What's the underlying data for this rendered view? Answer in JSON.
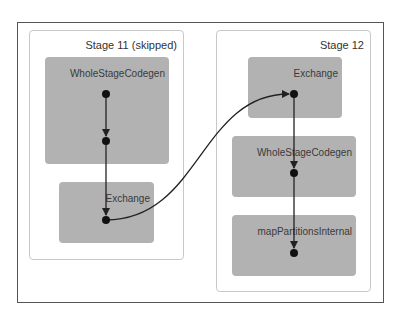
{
  "stages": [
    {
      "label": "Stage 11 (skipped)",
      "operators": [
        {
          "label": "WholeStageCodegen"
        },
        {
          "label": "Exchange"
        }
      ]
    },
    {
      "label": "Stage 12",
      "operators": [
        {
          "label": "Exchange"
        },
        {
          "label": "WholeStageCodegen"
        },
        {
          "label": "mapPartitionsInternal"
        }
      ]
    }
  ],
  "edges": [
    {
      "from": "stage11.WholeStageCodegen.node1",
      "to": "stage11.WholeStageCodegen.node2"
    },
    {
      "from": "stage11.WholeStageCodegen.node2",
      "to": "stage11.Exchange.node"
    },
    {
      "from": "stage11.Exchange.node",
      "to": "stage12.Exchange.node"
    },
    {
      "from": "stage12.Exchange.node",
      "to": "stage12.WholeStageCodegen.node"
    },
    {
      "from": "stage12.WholeStageCodegen.node",
      "to": "stage12.mapPartitionsInternal.node"
    }
  ],
  "colors": {
    "frame": "#555555",
    "stage_border": "#c8c8c8",
    "operator_fill": "#b2b2b2",
    "edge": "#222222",
    "node": "#111111"
  }
}
